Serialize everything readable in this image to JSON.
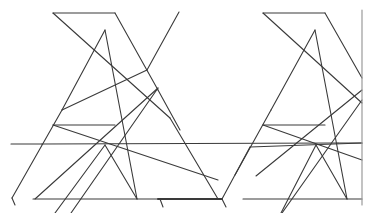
{
  "diagram": {
    "background": "#ffffff",
    "stroke": "#3a3a3a",
    "border_stroke": "#9a9a9a",
    "figures": [
      {
        "name": "left-figure",
        "lines": [
          [
            53,
            13,
            115,
            13
          ],
          [
            53,
            13,
            170,
            118
          ],
          [
            170,
            118,
            218,
            199
          ],
          [
            115,
            13,
            158,
            90
          ],
          [
            158,
            90,
            180,
            130
          ],
          [
            105,
            30,
            62,
            110
          ],
          [
            62,
            110,
            12,
            198
          ],
          [
            12,
            198,
            15,
            205
          ],
          [
            105,
            30,
            137,
            199
          ],
          [
            179,
            12,
            147,
            70
          ],
          [
            147,
            70,
            62,
            110
          ],
          [
            158,
            88,
            35,
            199
          ],
          [
            158,
            88,
            71,
            213
          ],
          [
            53,
            125,
            115,
            125
          ],
          [
            53,
            125,
            218,
            180
          ],
          [
            105,
            145,
            137,
            199
          ],
          [
            105,
            145,
            55,
            213
          ],
          [
            33,
            199,
            218,
            199
          ],
          [
            11,
            144,
            42,
            144
          ]
        ]
      },
      {
        "name": "right-figure",
        "lines": [
          [
            263,
            13,
            325,
            13
          ],
          [
            263,
            13,
            362,
            103
          ],
          [
            325,
            13,
            362,
            78
          ],
          [
            315,
            30,
            271,
            110
          ],
          [
            271,
            110,
            235,
            175
          ],
          [
            315,
            30,
            347,
            199
          ],
          [
            362,
            90,
            256,
            176
          ],
          [
            362,
            100,
            282,
            213
          ],
          [
            263,
            125,
            325,
            125
          ],
          [
            263,
            125,
            362,
            160
          ],
          [
            316,
            145,
            347,
            199
          ],
          [
            316,
            145,
            281,
            213
          ],
          [
            243,
            199,
            362,
            199
          ],
          [
            338,
            143,
            362,
            143
          ],
          [
            222,
            199,
            250,
            147
          ],
          [
            250,
            147,
            362,
            143
          ]
        ]
      }
    ],
    "extra_lines": [
      [
        42,
        144,
        338,
        143
      ],
      [
        158,
        199,
        222,
        199
      ],
      [
        222,
        199,
        226,
        207
      ],
      [
        160,
        199,
        163,
        207
      ]
    ],
    "right_border": [
      362,
      10,
      362,
      205
    ]
  }
}
